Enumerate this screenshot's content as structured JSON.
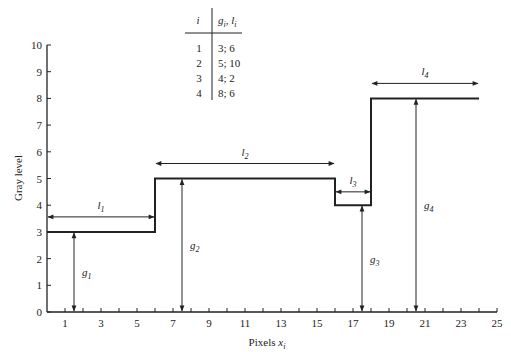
{
  "chart_data": {
    "type": "line",
    "subtype": "step",
    "title": "",
    "xlabel": "Pixels x_i",
    "ylabel": "Gray level",
    "xlim": [
      0,
      25
    ],
    "ylim": [
      0,
      10
    ],
    "grid": false,
    "x_tick_labels": [
      "1",
      "3",
      "5",
      "7",
      "9",
      "11",
      "13",
      "15",
      "17",
      "19",
      "21",
      "23",
      "25"
    ],
    "x_minor_ticks": [
      1,
      2,
      3,
      4,
      5,
      6,
      7,
      8,
      9,
      10,
      11,
      12,
      13,
      14,
      15,
      16,
      17,
      18,
      19,
      20,
      21,
      22,
      23,
      24,
      25
    ],
    "y_tick_labels": [
      "0",
      "1",
      "2",
      "3",
      "4",
      "5",
      "6",
      "7",
      "8",
      "9",
      "10"
    ],
    "segments": [
      {
        "i": 1,
        "g": 3,
        "l": 6,
        "x_start": 0,
        "x_end": 6,
        "label_l": "l1",
        "label_g": "g1"
      },
      {
        "i": 2,
        "g": 5,
        "l": 10,
        "x_start": 6,
        "x_end": 16,
        "label_l": "l2",
        "label_g": "g2"
      },
      {
        "i": 3,
        "g": 4,
        "l": 2,
        "x_start": 16,
        "x_end": 18,
        "label_l": "l3",
        "label_g": "g3"
      },
      {
        "i": 4,
        "g": 8,
        "l": 6,
        "x_start": 18,
        "x_end": 24,
        "label_l": "l4",
        "label_g": "g4"
      }
    ],
    "g_arrow_x": [
      1.5,
      7.5,
      17.5,
      20.5
    ],
    "table": {
      "headers": [
        "i",
        "g_i, l_i"
      ],
      "rows": [
        [
          "1",
          "3; 6"
        ],
        [
          "2",
          "5; 10"
        ],
        [
          "3",
          "4; 2"
        ],
        [
          "4",
          "8; 6"
        ]
      ]
    }
  },
  "labels": {
    "xlabel_main": "Pixels ",
    "xlabel_var": "x",
    "xlabel_sub": "i",
    "ylabel": "Gray level",
    "table_h1": "i",
    "table_h2": "g",
    "table_h2_sub": "i",
    "table_h2_sep": ", ",
    "table_h2b": "l",
    "table_h2b_sub": "i",
    "l_symbol": "l",
    "g_symbol": "g"
  },
  "colors": {
    "line": "#222222",
    "background": "#ffffff"
  }
}
